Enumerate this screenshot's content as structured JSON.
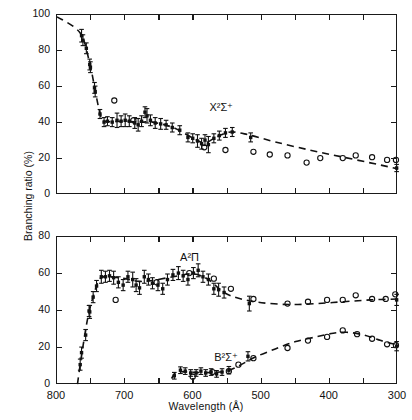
{
  "figure": {
    "xlabel": "Wavelength  (Å)",
    "ylabel": "Branching ratio (%)"
  },
  "chart_data": [
    {
      "type": "scatter",
      "panel": "top",
      "title": "",
      "xlabel": "Wavelength  (Å)",
      "ylabel": "Branching ratio (%)",
      "xlim": [
        800,
        300
      ],
      "ylim": [
        0,
        100
      ],
      "xticks": [
        800,
        750,
        700,
        650,
        600,
        550,
        500,
        450,
        400,
        350,
        300
      ],
      "xticklabels": [
        "800",
        "",
        "700",
        "",
        "600",
        "",
        "500",
        "",
        "400",
        "",
        "300"
      ],
      "yticks": [
        0,
        20,
        40,
        60,
        80,
        100
      ],
      "yticklabels": [
        "0",
        "20",
        "40",
        "60",
        "80",
        "100"
      ],
      "grid": false,
      "legend": "none",
      "annotations": [
        {
          "text": "X2S+",
          "display": "X²Σ⁺",
          "x": 575,
          "y": 48
        }
      ],
      "series": [
        {
          "name": "X2Sigma+ measured",
          "marker": "filled-square-with-error-bars",
          "points": [
            {
              "x": 764,
              "y": 88.5,
              "err": 3.5
            },
            {
              "x": 762,
              "y": 86.0,
              "err": 3.0
            },
            {
              "x": 757,
              "y": 81.5,
              "err": 3.0
            },
            {
              "x": 752,
              "y": 72.5,
              "err": 3.0
            },
            {
              "x": 751,
              "y": 71.0,
              "err": 3.0
            },
            {
              "x": 745,
              "y": 59.5,
              "err": 3.0
            },
            {
              "x": 744,
              "y": 57.5,
              "err": 3.0
            },
            {
              "x": 737,
              "y": 45.0,
              "err": 2.5
            },
            {
              "x": 731,
              "y": 40.5,
              "err": 2.5
            },
            {
              "x": 726,
              "y": 41.0,
              "err": 2.5
            },
            {
              "x": 719,
              "y": 40.5,
              "err": 2.5
            },
            {
              "x": 712,
              "y": 41.5,
              "err": 4.0
            },
            {
              "x": 706,
              "y": 41.0,
              "err": 3.0
            },
            {
              "x": 700,
              "y": 41.5,
              "err": 3.5
            },
            {
              "x": 694,
              "y": 41.0,
              "err": 3.0
            },
            {
              "x": 686,
              "y": 40.0,
              "err": 3.0
            },
            {
              "x": 681,
              "y": 39.0,
              "err": 3.5
            },
            {
              "x": 676,
              "y": 41.0,
              "err": 3.0
            },
            {
              "x": 671,
              "y": 46.0,
              "err": 3.0
            },
            {
              "x": 668,
              "y": 44.0,
              "err": 4.0
            },
            {
              "x": 663,
              "y": 41.5,
              "err": 3.0
            },
            {
              "x": 656,
              "y": 40.0,
              "err": 3.0
            },
            {
              "x": 648,
              "y": 39.5,
              "err": 3.0
            },
            {
              "x": 640,
              "y": 39.0,
              "err": 2.5
            },
            {
              "x": 631,
              "y": 37.5,
              "err": 2.5
            },
            {
              "x": 620,
              "y": 36.0,
              "err": 2.5
            },
            {
              "x": 608,
              "y": 32.0,
              "err": 2.5
            },
            {
              "x": 601,
              "y": 31.5,
              "err": 2.5
            },
            {
              "x": 594,
              "y": 30.0,
              "err": 3.5
            },
            {
              "x": 588,
              "y": 28.5,
              "err": 3.0
            },
            {
              "x": 583,
              "y": 30.5,
              "err": 3.0
            },
            {
              "x": 578,
              "y": 28.0,
              "err": 4.5
            },
            {
              "x": 570,
              "y": 31.5,
              "err": 2.5
            },
            {
              "x": 562,
              "y": 33.0,
              "err": 2.5
            },
            {
              "x": 553,
              "y": 34.5,
              "err": 2.5
            },
            {
              "x": 543,
              "y": 35.0,
              "err": 2.5
            },
            {
              "x": 516,
              "y": 32.0,
              "err": 2.5
            },
            {
              "x": 302,
              "y": 15.0,
              "err": 2.0
            }
          ]
        },
        {
          "name": "X2Sigma+ other work",
          "marker": "open-circle",
          "points": [
            {
              "x": 716,
              "y": 52.5
            },
            {
              "x": 688,
              "y": 41.5
            },
            {
              "x": 584,
              "y": 26.5
            },
            {
              "x": 553,
              "y": 25.0
            },
            {
              "x": 512,
              "y": 24.0
            },
            {
              "x": 488,
              "y": 22.5
            },
            {
              "x": 462,
              "y": 22.0
            },
            {
              "x": 434,
              "y": 18.0
            },
            {
              "x": 414,
              "y": 20.5
            },
            {
              "x": 381,
              "y": 20.5
            },
            {
              "x": 362,
              "y": 22.0
            },
            {
              "x": 338,
              "y": 21.0
            },
            {
              "x": 316,
              "y": 19.5
            },
            {
              "x": 303,
              "y": 19.5
            }
          ]
        },
        {
          "name": "X2Sigma+ fit",
          "marker": "dashed-curve",
          "points": [
            {
              "x": 800,
              "y": 99.0
            },
            {
              "x": 766,
              "y": 90.0
            },
            {
              "x": 752,
              "y": 73.0
            },
            {
              "x": 744,
              "y": 58.0
            },
            {
              "x": 737,
              "y": 45.5
            },
            {
              "x": 730,
              "y": 41.0
            },
            {
              "x": 700,
              "y": 41.0
            },
            {
              "x": 676,
              "y": 40.5
            },
            {
              "x": 660,
              "y": 40.5
            },
            {
              "x": 630,
              "y": 37.5
            },
            {
              "x": 600,
              "y": 31.5
            },
            {
              "x": 583,
              "y": 29.0
            },
            {
              "x": 565,
              "y": 32.5
            },
            {
              "x": 545,
              "y": 35.0
            },
            {
              "x": 520,
              "y": 33.5
            },
            {
              "x": 480,
              "y": 29.5
            },
            {
              "x": 430,
              "y": 25.0
            },
            {
              "x": 380,
              "y": 21.0
            },
            {
              "x": 330,
              "y": 17.0
            },
            {
              "x": 300,
              "y": 14.5
            }
          ]
        }
      ]
    },
    {
      "type": "scatter",
      "panel": "bottom",
      "title": "",
      "xlabel": "Wavelength  (Å)",
      "ylabel": "Branching ratio (%)",
      "xlim": [
        800,
        300
      ],
      "ylim": [
        0,
        80
      ],
      "xticks": [
        800,
        750,
        700,
        650,
        600,
        550,
        500,
        450,
        400,
        350,
        300
      ],
      "xticklabels": [
        "800",
        "",
        "700",
        "",
        "600",
        "",
        "500",
        "",
        "400",
        "",
        "300"
      ],
      "yticks": [
        0,
        20,
        40,
        60,
        80
      ],
      "yticklabels": [
        "0",
        "20",
        "40",
        "60",
        "80"
      ],
      "grid": false,
      "legend": "none",
      "annotations": [
        {
          "text": "A2Pi",
          "display": "A²Π",
          "x": 618,
          "y": 68
        },
        {
          "text": "B2S+",
          "display": "B²Σ⁺",
          "x": 568,
          "y": 14
        }
      ],
      "series": [
        {
          "name": "A2Pi measured",
          "marker": "filled-square-with-error-bars",
          "points": [
            {
              "x": 766,
              "y": 11.0,
              "err": 3.0
            },
            {
              "x": 764,
              "y": 17.5,
              "err": 3.0
            },
            {
              "x": 758,
              "y": 27.0,
              "err": 3.0
            },
            {
              "x": 753,
              "y": 40.0,
              "err": 3.0
            },
            {
              "x": 752,
              "y": 39.5,
              "err": 3.5
            },
            {
              "x": 747,
              "y": 47.5,
              "err": 3.0
            },
            {
              "x": 742,
              "y": 53.5,
              "err": 3.0
            },
            {
              "x": 735,
              "y": 58.5,
              "err": 3.5
            },
            {
              "x": 729,
              "y": 58.5,
              "err": 3.0
            },
            {
              "x": 723,
              "y": 59.0,
              "err": 3.0
            },
            {
              "x": 717,
              "y": 58.0,
              "err": 3.5
            },
            {
              "x": 710,
              "y": 55.5,
              "err": 3.0
            },
            {
              "x": 703,
              "y": 54.0,
              "err": 3.0
            },
            {
              "x": 696,
              "y": 58.5,
              "err": 3.0
            },
            {
              "x": 689,
              "y": 57.0,
              "err": 4.0
            },
            {
              "x": 684,
              "y": 54.0,
              "err": 3.5
            },
            {
              "x": 679,
              "y": 52.5,
              "err": 3.5
            },
            {
              "x": 672,
              "y": 58.5,
              "err": 3.5
            },
            {
              "x": 666,
              "y": 57.0,
              "err": 3.0
            },
            {
              "x": 660,
              "y": 55.0,
              "err": 3.0
            },
            {
              "x": 652,
              "y": 54.0,
              "err": 3.0
            },
            {
              "x": 645,
              "y": 52.0,
              "err": 3.0
            },
            {
              "x": 638,
              "y": 57.0,
              "err": 3.0
            },
            {
              "x": 630,
              "y": 59.5,
              "err": 3.0
            },
            {
              "x": 622,
              "y": 60.5,
              "err": 3.5
            },
            {
              "x": 615,
              "y": 59.0,
              "err": 3.0
            },
            {
              "x": 608,
              "y": 57.0,
              "err": 3.0
            },
            {
              "x": 600,
              "y": 60.5,
              "err": 3.0
            },
            {
              "x": 593,
              "y": 62.0,
              "err": 3.5
            },
            {
              "x": 586,
              "y": 58.5,
              "err": 3.0
            },
            {
              "x": 578,
              "y": 57.0,
              "err": 3.0
            },
            {
              "x": 570,
              "y": 52.0,
              "err": 3.0
            },
            {
              "x": 563,
              "y": 51.5,
              "err": 3.5
            },
            {
              "x": 555,
              "y": 50.0,
              "err": 3.0
            },
            {
              "x": 518,
              "y": 44.0,
              "err": 4.0
            },
            {
              "x": 302,
              "y": 46.0,
              "err": 3.0
            }
          ]
        },
        {
          "name": "A2Pi other work",
          "marker": "open-circle",
          "points": [
            {
              "x": 714,
              "y": 46.0
            },
            {
              "x": 654,
              "y": 55.5
            },
            {
              "x": 606,
              "y": 60.5
            },
            {
              "x": 570,
              "y": 57.5
            },
            {
              "x": 545,
              "y": 52.0
            },
            {
              "x": 512,
              "y": 46.5
            },
            {
              "x": 462,
              "y": 44.0
            },
            {
              "x": 432,
              "y": 45.0
            },
            {
              "x": 404,
              "y": 46.0
            },
            {
              "x": 381,
              "y": 46.0
            },
            {
              "x": 362,
              "y": 48.5
            },
            {
              "x": 338,
              "y": 46.5
            },
            {
              "x": 318,
              "y": 46.5
            },
            {
              "x": 304,
              "y": 49.0
            }
          ]
        },
        {
          "name": "A2Pi fit",
          "marker": "dashed-curve",
          "points": [
            {
              "x": 770,
              "y": 0.5
            },
            {
              "x": 764,
              "y": 16.0
            },
            {
              "x": 755,
              "y": 36.0
            },
            {
              "x": 746,
              "y": 49.0
            },
            {
              "x": 737,
              "y": 57.5
            },
            {
              "x": 725,
              "y": 58.5
            },
            {
              "x": 700,
              "y": 57.5
            },
            {
              "x": 680,
              "y": 56.0
            },
            {
              "x": 660,
              "y": 56.5
            },
            {
              "x": 630,
              "y": 58.5
            },
            {
              "x": 600,
              "y": 60.0
            },
            {
              "x": 578,
              "y": 57.0
            },
            {
              "x": 555,
              "y": 50.0
            },
            {
              "x": 530,
              "y": 46.5
            },
            {
              "x": 500,
              "y": 44.5
            },
            {
              "x": 460,
              "y": 43.5
            },
            {
              "x": 420,
              "y": 44.0
            },
            {
              "x": 380,
              "y": 45.0
            },
            {
              "x": 340,
              "y": 46.0
            },
            {
              "x": 300,
              "y": 46.5
            }
          ]
        },
        {
          "name": "B2Sigma+ measured",
          "marker": "filled-square-with-error-bars",
          "points": [
            {
              "x": 628,
              "y": 5.0,
              "err": 1.8
            },
            {
              "x": 619,
              "y": 8.0,
              "err": 1.8
            },
            {
              "x": 612,
              "y": 7.5,
              "err": 1.8
            },
            {
              "x": 604,
              "y": 6.5,
              "err": 1.8
            },
            {
              "x": 596,
              "y": 6.5,
              "err": 1.8
            },
            {
              "x": 589,
              "y": 7.5,
              "err": 1.8
            },
            {
              "x": 582,
              "y": 6.5,
              "err": 1.8
            },
            {
              "x": 574,
              "y": 7.0,
              "err": 1.8
            },
            {
              "x": 566,
              "y": 6.0,
              "err": 1.8
            },
            {
              "x": 558,
              "y": 7.0,
              "err": 1.8
            },
            {
              "x": 548,
              "y": 8.0,
              "err": 2.0
            },
            {
              "x": 520,
              "y": 15.5,
              "err": 2.5
            },
            {
              "x": 302,
              "y": 21.0,
              "err": 2.5
            }
          ]
        },
        {
          "name": "B2Sigma+ other work",
          "marker": "open-circle",
          "points": [
            {
              "x": 601,
              "y": 4.5
            },
            {
              "x": 572,
              "y": 7.0
            },
            {
              "x": 548,
              "y": 7.5
            },
            {
              "x": 534,
              "y": 11.0
            },
            {
              "x": 512,
              "y": 14.5
            },
            {
              "x": 462,
              "y": 20.0
            },
            {
              "x": 432,
              "y": 24.0
            },
            {
              "x": 404,
              "y": 26.0
            },
            {
              "x": 381,
              "y": 29.5
            },
            {
              "x": 360,
              "y": 27.5
            },
            {
              "x": 338,
              "y": 25.0
            },
            {
              "x": 316,
              "y": 22.0
            },
            {
              "x": 303,
              "y": 21.5
            }
          ]
        },
        {
          "name": "B2Sigma+ fit",
          "marker": "dashed-curve",
          "points": [
            {
              "x": 632,
              "y": 3.5
            },
            {
              "x": 624,
              "y": 7.0
            },
            {
              "x": 600,
              "y": 6.8
            },
            {
              "x": 570,
              "y": 6.8
            },
            {
              "x": 548,
              "y": 8.0
            },
            {
              "x": 530,
              "y": 11.0
            },
            {
              "x": 510,
              "y": 15.0
            },
            {
              "x": 480,
              "y": 19.5
            },
            {
              "x": 450,
              "y": 23.5
            },
            {
              "x": 420,
              "y": 26.0
            },
            {
              "x": 395,
              "y": 28.0
            },
            {
              "x": 375,
              "y": 28.5
            },
            {
              "x": 350,
              "y": 27.0
            },
            {
              "x": 325,
              "y": 24.0
            },
            {
              "x": 300,
              "y": 21.5
            }
          ]
        }
      ]
    }
  ]
}
